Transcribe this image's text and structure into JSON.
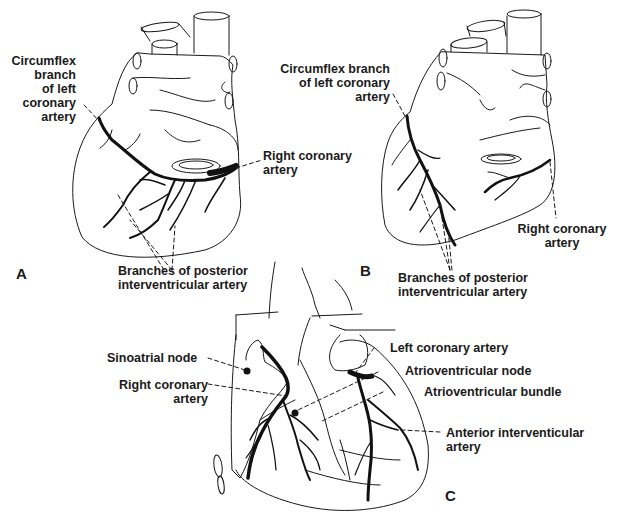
{
  "figure": {
    "panels": [
      {
        "id": "A",
        "letter": "A",
        "labels": {
          "circumflex_line1": "Circumflex",
          "circumflex_line2": "branch",
          "circumflex_line3": "of left",
          "circumflex_line4": "coronary",
          "circumflex_line5": "artery",
          "rca_line1": "Right coronary",
          "rca_line2": "artery",
          "pia_line1": "Branches of posterior",
          "pia_line2": "interventricular artery"
        }
      },
      {
        "id": "B",
        "letter": "B",
        "labels": {
          "circumflex_line1": "Circumflex branch",
          "circumflex_line2": "of left coronary",
          "circumflex_line3": "artery",
          "rca_line1": "Right coronary",
          "rca_line2": "artery",
          "pia_line1": "Branches of posterior",
          "pia_line2": "interventricular artery"
        }
      },
      {
        "id": "C",
        "letter": "C",
        "labels": {
          "sa_node": "Sinoatrial node",
          "rca_line1": "Right coronary",
          "rca_line2": "artery",
          "lca": "Left coronary artery",
          "av_node": "Atrioventricular node",
          "av_bundle": "Atrioventricular bundle",
          "lad_line1": "Anterior interventicular",
          "lad_line2": "artery"
        }
      }
    ]
  }
}
